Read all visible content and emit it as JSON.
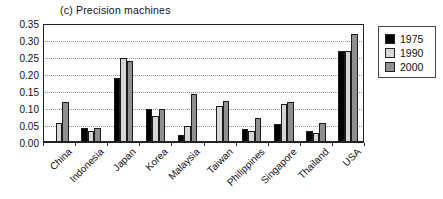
{
  "chart_data": {
    "type": "bar",
    "title": "(c) Precision machines",
    "categories": [
      "China",
      "Indonesia",
      "Japan",
      "Korea",
      "Malaysia",
      "Taiwan",
      "Philippines",
      "Singapore",
      "Thailand",
      "USA"
    ],
    "series": [
      {
        "name": "1975",
        "color": "#000000",
        "values": [
          null,
          0.045,
          0.19,
          0.1,
          0.025,
          null,
          0.04,
          0.055,
          0.035,
          0.27
        ]
      },
      {
        "name": "1990",
        "color": "#d6d6d6",
        "values": [
          0.06,
          0.035,
          0.25,
          0.08,
          0.05,
          0.11,
          0.035,
          0.115,
          0.03,
          0.27
        ]
      },
      {
        "name": "2000",
        "color": "#8f8f8f",
        "values": [
          0.12,
          0.045,
          0.24,
          0.1,
          0.145,
          0.125,
          0.075,
          0.12,
          0.06,
          0.32
        ]
      }
    ],
    "xlabel": "",
    "ylabel": "",
    "ylim": [
      0,
      0.35
    ],
    "ytick_labels": [
      "0.35",
      "0.30",
      "0.25",
      "0.20",
      "0.15",
      "0.10",
      "0.05",
      "0.00"
    ],
    "grid": "horizontal dotted lines every 0.05",
    "legend_position": "outside top-right",
    "bar_outline_color": "#1c1c1c"
  }
}
